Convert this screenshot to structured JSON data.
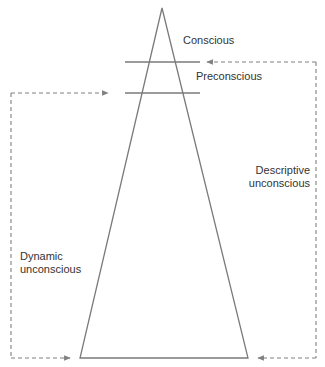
{
  "diagram": {
    "type": "iceberg-triangle",
    "colors": {
      "line": "#7a7a7a",
      "dashed": "#808080",
      "text": "#333333"
    },
    "triangle": {
      "apex": [
        162,
        8
      ],
      "base_left": [
        80,
        358
      ],
      "base_right": [
        248,
        358
      ]
    },
    "divider_lines": [
      {
        "y": 62,
        "x1": 125,
        "x2": 200
      },
      {
        "y": 93,
        "x1": 125,
        "x2": 200
      }
    ],
    "labels": {
      "conscious": "Conscious",
      "preconscious": "Preconscious",
      "descriptive_line1": "Descriptive",
      "descriptive_line2": "unconscious",
      "dynamic_line1": "Dynamic",
      "dynamic_line2": "unconscious"
    },
    "brackets": {
      "descriptive": {
        "x": 316,
        "y_top": 62,
        "y_bottom": 358,
        "arrow_top_end_x": 207,
        "arrow_bottom_end_x": 258
      },
      "dynamic": {
        "x": 11,
        "y_top": 93,
        "y_bottom": 358,
        "arrow_top_end_x": 108,
        "arrow_bottom_end_x": 70
      }
    }
  }
}
